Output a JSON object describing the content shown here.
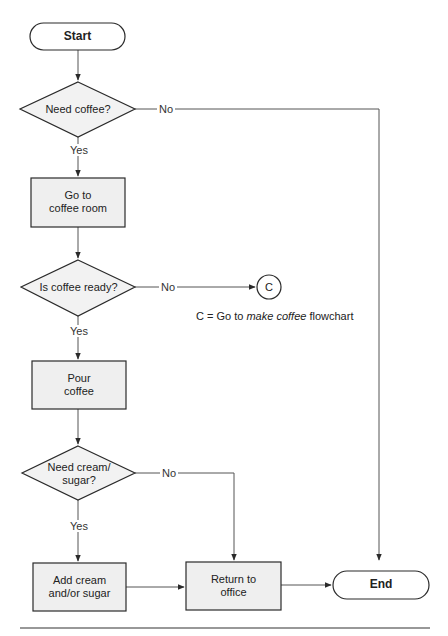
{
  "diagram": {
    "type": "flowchart",
    "nodes": {
      "start": {
        "label": "Start",
        "shape": "terminator"
      },
      "need_coffee": {
        "label": "Need coffee?",
        "shape": "decision"
      },
      "go_room": {
        "line1": "Go to",
        "line2": "coffee room",
        "shape": "process"
      },
      "is_ready": {
        "label": "Is coffee ready?",
        "shape": "decision"
      },
      "connector_c": {
        "label": "C",
        "shape": "connector"
      },
      "pour": {
        "line1": "Pour",
        "line2": "coffee",
        "shape": "process"
      },
      "need_cream": {
        "line1": "Need cream/",
        "line2": "sugar?",
        "shape": "decision"
      },
      "add_cream": {
        "line1": "Add cream",
        "line2": "and/or sugar",
        "shape": "process"
      },
      "return_office": {
        "line1": "Return to",
        "line2": "office",
        "shape": "process"
      },
      "end": {
        "label": "End",
        "shape": "terminator"
      }
    },
    "edge_labels": {
      "need_coffee_no": "No",
      "need_coffee_yes": "Yes",
      "is_ready_no": "No",
      "is_ready_yes": "Yes",
      "need_cream_no": "No",
      "need_cream_yes": "Yes"
    },
    "note": {
      "prefix": "C = Go to ",
      "italic": "make coffee",
      "suffix": " flowchart"
    },
    "edges": [
      [
        "start",
        "need_coffee"
      ],
      [
        "need_coffee",
        "go_room",
        "Yes"
      ],
      [
        "need_coffee",
        "end",
        "No"
      ],
      [
        "go_room",
        "is_ready"
      ],
      [
        "is_ready",
        "pour",
        "Yes"
      ],
      [
        "is_ready",
        "connector_c",
        "No"
      ],
      [
        "pour",
        "need_cream"
      ],
      [
        "need_cream",
        "add_cream",
        "Yes"
      ],
      [
        "need_cream",
        "return_office",
        "No"
      ],
      [
        "add_cream",
        "return_office"
      ],
      [
        "return_office",
        "end"
      ]
    ],
    "colors": {
      "stroke": "#2a2a2a",
      "line": "#555555",
      "fill": "#f0f0f0",
      "terminator_fill": "#ffffff"
    }
  }
}
